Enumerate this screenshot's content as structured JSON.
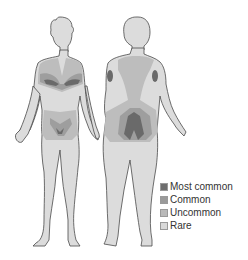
{
  "figure": {
    "views": [
      "front",
      "back"
    ]
  },
  "legend": {
    "items": [
      {
        "label": "Most common",
        "color": "#6e6e6e"
      },
      {
        "label": "Common",
        "color": "#9a9a9a"
      },
      {
        "label": "Uncommon",
        "color": "#b9b9b9"
      },
      {
        "label": "Rare",
        "color": "#d9d9d9"
      }
    ]
  },
  "colors": {
    "outline": "#4a4a4a",
    "skin_rare": "#dcdcdc",
    "uncommon": "#bdbdbd",
    "common": "#9e9e9e",
    "most_common": "#6a6a6a"
  }
}
